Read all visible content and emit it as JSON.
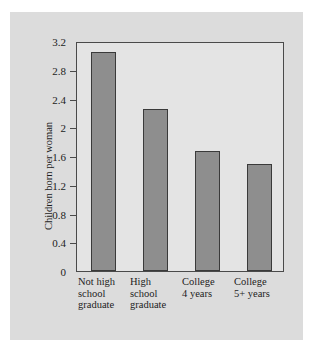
{
  "chart_data": {
    "type": "bar",
    "title": "",
    "xlabel": "",
    "ylabel": "Children born per woman",
    "categories": [
      "Not high school graduate",
      "High school graduate",
      "College 4 years",
      "College 5+ years"
    ],
    "category_lines": [
      [
        "Not high",
        "school",
        "graduate"
      ],
      [
        "High",
        "school",
        "graduate"
      ],
      [
        "College",
        "4 years"
      ],
      [
        "College",
        "5+ years"
      ]
    ],
    "values": [
      3.05,
      2.26,
      1.67,
      1.49
    ],
    "ylim": [
      0,
      3.2
    ],
    "ytick_labels": [
      "0",
      "0.4",
      "0.8",
      "1.2",
      "1.6",
      "2",
      "2.4",
      "2.8",
      "3.2"
    ],
    "ytick_values": [
      0,
      0.4,
      0.8,
      1.2,
      1.6,
      2,
      2.4,
      2.8,
      3.2
    ],
    "grid": false,
    "legend": "none",
    "colors": {
      "bar_fill": "#8e8e8e",
      "bar_edge": "#3a3a3a",
      "plot_background": "#e4e4e4",
      "card_background": "#dcdcdc",
      "axis": "#4a4a4a",
      "text": "#1d1d1d"
    }
  }
}
